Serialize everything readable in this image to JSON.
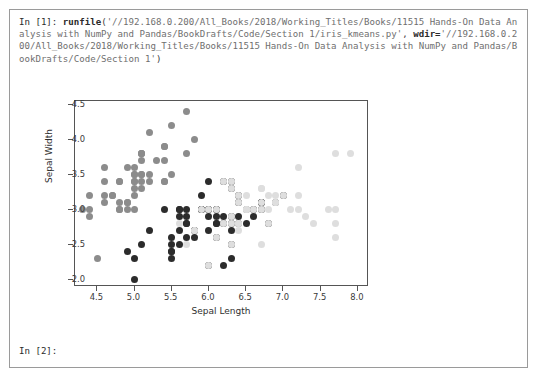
{
  "console": {
    "prompt_in_1": "In [1]:",
    "function": "runfile",
    "open_paren": "(",
    "arg_path": "'//192.168.0.200/All_Books/2018/Working_Titles/Books/11515 Hands-On Data Analysis with NumPy and Pandas/BookDrafts/Code/Section 1/iris_kmeans.py'",
    "comma": ",",
    "kwarg_name": "wdir=",
    "kwarg_path": "'//192.168.0.200/All_Books/2018/Working_Titles/Books/11515 Hands-On Data Analysis with NumPy and Pandas/BookDrafts/Code/Section 1'",
    "close_paren": ")",
    "prompt_in_2": "In [2]:"
  },
  "colors": {
    "cluster_dark": "#2c2c2c",
    "cluster_mid": "#8c8c8c",
    "cluster_light": "#dedede",
    "axis": "#555555",
    "window_border": "#9a9a9a",
    "text": "#3b3b3b"
  },
  "chart_data": {
    "type": "scatter",
    "title": "",
    "xlabel": "Sepal Length",
    "ylabel": "Sepal Width",
    "xlim": [
      4.2,
      8.15
    ],
    "ylim": [
      1.9,
      4.55
    ],
    "xticks": [
      4.5,
      5.0,
      5.5,
      6.0,
      6.5,
      7.0,
      7.5,
      8.0
    ],
    "xticklabels": [
      "4.5",
      "5.0",
      "5.5",
      "6.0",
      "6.5",
      "7.0",
      "7.5",
      "8.0"
    ],
    "yticks": [
      2.0,
      2.5,
      3.0,
      3.5,
      4.0,
      4.5
    ],
    "yticklabels": [
      "2.0",
      "2.5",
      "3.0",
      "3.5",
      "4.0",
      "4.5"
    ],
    "grid": false,
    "legend": "none",
    "marker_size": 7,
    "series": [
      {
        "name": "cluster-0",
        "color": "#8c8c8c",
        "points": [
          [
            5.1,
            3.5
          ],
          [
            4.9,
            3.0
          ],
          [
            4.7,
            3.2
          ],
          [
            4.6,
            3.1
          ],
          [
            5.0,
            3.6
          ],
          [
            5.4,
            3.9
          ],
          [
            4.6,
            3.4
          ],
          [
            5.0,
            3.4
          ],
          [
            4.4,
            2.9
          ],
          [
            4.9,
            3.1
          ],
          [
            5.4,
            3.7
          ],
          [
            4.8,
            3.4
          ],
          [
            4.8,
            3.0
          ],
          [
            4.3,
            3.0
          ],
          [
            5.8,
            4.0
          ],
          [
            5.7,
            4.4
          ],
          [
            5.4,
            3.9
          ],
          [
            5.1,
            3.5
          ],
          [
            5.7,
            3.8
          ],
          [
            5.1,
            3.8
          ],
          [
            5.4,
            3.4
          ],
          [
            5.1,
            3.7
          ],
          [
            4.6,
            3.6
          ],
          [
            5.1,
            3.3
          ],
          [
            4.8,
            3.4
          ],
          [
            5.0,
            3.0
          ],
          [
            5.0,
            3.4
          ],
          [
            5.2,
            3.5
          ],
          [
            5.2,
            3.4
          ],
          [
            4.7,
            3.2
          ],
          [
            4.8,
            3.1
          ],
          [
            5.4,
            3.4
          ],
          [
            5.2,
            4.1
          ],
          [
            5.5,
            4.2
          ],
          [
            4.9,
            3.1
          ],
          [
            5.0,
            3.2
          ],
          [
            5.5,
            3.5
          ],
          [
            4.9,
            3.6
          ],
          [
            4.4,
            3.0
          ],
          [
            5.1,
            3.4
          ],
          [
            5.0,
            3.5
          ],
          [
            4.5,
            2.3
          ],
          [
            4.4,
            3.2
          ],
          [
            5.0,
            3.5
          ],
          [
            5.1,
            3.8
          ],
          [
            4.8,
            3.0
          ],
          [
            5.1,
            3.8
          ],
          [
            4.6,
            3.2
          ],
          [
            5.3,
            3.7
          ],
          [
            5.0,
            3.3
          ]
        ]
      },
      {
        "name": "cluster-1",
        "color": "#2c2c2c",
        "points": [
          [
            7.0,
            3.2
          ],
          [
            6.4,
            3.2
          ],
          [
            6.9,
            3.1
          ],
          [
            5.5,
            2.3
          ],
          [
            6.5,
            2.8
          ],
          [
            5.7,
            2.8
          ],
          [
            6.3,
            3.3
          ],
          [
            4.9,
            2.4
          ],
          [
            6.6,
            2.9
          ],
          [
            5.2,
            2.7
          ],
          [
            5.0,
            2.0
          ],
          [
            5.9,
            3.0
          ],
          [
            6.0,
            2.2
          ],
          [
            6.1,
            2.9
          ],
          [
            5.6,
            2.9
          ],
          [
            6.7,
            3.1
          ],
          [
            5.6,
            3.0
          ],
          [
            5.8,
            2.7
          ],
          [
            6.2,
            2.2
          ],
          [
            5.6,
            2.5
          ],
          [
            5.9,
            3.2
          ],
          [
            6.1,
            2.8
          ],
          [
            6.3,
            2.5
          ],
          [
            6.1,
            2.8
          ],
          [
            6.4,
            2.9
          ],
          [
            6.6,
            3.0
          ],
          [
            6.8,
            2.8
          ],
          [
            6.7,
            3.0
          ],
          [
            6.0,
            2.9
          ],
          [
            5.7,
            2.6
          ],
          [
            5.5,
            2.4
          ],
          [
            5.5,
            2.4
          ],
          [
            5.8,
            2.7
          ],
          [
            6.0,
            2.7
          ],
          [
            5.4,
            3.0
          ],
          [
            6.0,
            3.4
          ],
          [
            6.7,
            3.1
          ],
          [
            6.3,
            2.3
          ],
          [
            5.6,
            3.0
          ],
          [
            5.5,
            2.5
          ],
          [
            5.5,
            2.6
          ],
          [
            6.1,
            3.0
          ],
          [
            5.8,
            2.6
          ],
          [
            5.0,
            2.3
          ],
          [
            5.6,
            2.7
          ],
          [
            5.7,
            3.0
          ],
          [
            5.7,
            2.9
          ],
          [
            6.2,
            2.9
          ],
          [
            5.1,
            2.5
          ],
          [
            5.7,
            2.8
          ],
          [
            6.3,
            2.9
          ],
          [
            6.5,
            3.0
          ],
          [
            5.9,
            3.0
          ],
          [
            6.3,
            2.7
          ],
          [
            6.2,
            2.8
          ],
          [
            6.1,
            3.0
          ],
          [
            6.4,
            2.8
          ],
          [
            6.0,
            3.0
          ],
          [
            6.3,
            2.8
          ],
          [
            6.1,
            2.6
          ],
          [
            6.3,
            3.4
          ],
          [
            6.4,
            3.1
          ],
          [
            6.0,
            3.0
          ],
          [
            6.7,
            3.1
          ],
          [
            5.8,
            2.7
          ],
          [
            6.2,
            3.4
          ],
          [
            5.9,
            3.0
          ]
        ]
      },
      {
        "name": "cluster-2",
        "color": "#dedede",
        "points": [
          [
            6.3,
            3.3
          ],
          [
            5.8,
            2.7
          ],
          [
            7.1,
            3.0
          ],
          [
            6.3,
            2.9
          ],
          [
            6.5,
            3.0
          ],
          [
            7.6,
            3.0
          ],
          [
            7.3,
            2.9
          ],
          [
            6.7,
            2.5
          ],
          [
            7.2,
            3.6
          ],
          [
            6.5,
            3.2
          ],
          [
            6.4,
            2.7
          ],
          [
            6.8,
            3.0
          ],
          [
            5.7,
            2.5
          ],
          [
            6.4,
            3.2
          ],
          [
            6.5,
            3.0
          ],
          [
            7.7,
            3.8
          ],
          [
            7.7,
            2.6
          ],
          [
            6.9,
            3.2
          ],
          [
            5.6,
            2.8
          ],
          [
            7.7,
            2.8
          ],
          [
            6.7,
            3.3
          ],
          [
            7.2,
            3.2
          ],
          [
            6.2,
            2.8
          ],
          [
            6.1,
            3.0
          ],
          [
            6.4,
            2.8
          ],
          [
            7.2,
            3.0
          ],
          [
            7.4,
            2.8
          ],
          [
            7.9,
            3.8
          ],
          [
            6.4,
            2.8
          ],
          [
            6.3,
            2.8
          ],
          [
            6.1,
            2.6
          ],
          [
            7.7,
            3.0
          ],
          [
            6.3,
            3.4
          ],
          [
            6.4,
            3.1
          ],
          [
            6.0,
            3.0
          ],
          [
            6.9,
            3.1
          ],
          [
            6.7,
            3.1
          ],
          [
            6.9,
            3.1
          ],
          [
            5.8,
            2.7
          ],
          [
            6.8,
            3.2
          ],
          [
            6.7,
            3.3
          ],
          [
            6.7,
            3.0
          ],
          [
            6.5,
            3.0
          ],
          [
            6.2,
            3.4
          ],
          [
            5.9,
            3.0
          ],
          [
            6.6,
            3.0
          ],
          [
            6.8,
            2.8
          ],
          [
            6.0,
            2.2
          ],
          [
            6.3,
            2.5
          ],
          [
            7.0,
            3.2
          ]
        ]
      }
    ]
  }
}
